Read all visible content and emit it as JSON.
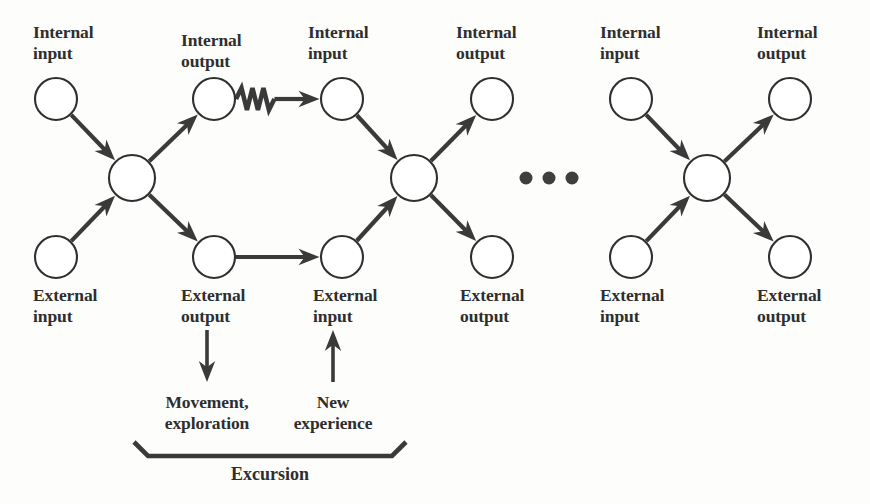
{
  "diagram": {
    "colors": {
      "stroke": "#3a3a3a",
      "node_stroke": "#2f2f2f",
      "node_fill": "#ffffff",
      "text": "#2e2e2e",
      "background": "#fdfdfc"
    },
    "labels": {
      "internal_input": "Internal\ninput",
      "internal_output": "Internal\noutput",
      "external_input": "External\ninput",
      "external_output": "External\noutput",
      "movement_exploration": "Movement,\nexploration",
      "new_experience": "New\nexperience",
      "excursion": "Excursion"
    },
    "nodes": [
      {
        "id": "n1-int-in",
        "name": "internal-input-node-1",
        "cx": 56,
        "cy": 99,
        "r": 21
      },
      {
        "id": "n1-ext-in",
        "name": "external-input-node-1",
        "cx": 56,
        "cy": 257,
        "r": 21
      },
      {
        "id": "n1-hub",
        "name": "hub-node-1",
        "cx": 132,
        "cy": 178,
        "r": 23
      },
      {
        "id": "n1-int-out",
        "name": "internal-output-node-1",
        "cx": 214,
        "cy": 99,
        "r": 21
      },
      {
        "id": "n1-ext-out",
        "name": "external-output-node-1",
        "cx": 214,
        "cy": 257,
        "r": 21
      },
      {
        "id": "n2-int-in",
        "name": "internal-input-node-2",
        "cx": 342,
        "cy": 99,
        "r": 21
      },
      {
        "id": "n2-ext-in",
        "name": "external-input-node-2",
        "cx": 342,
        "cy": 257,
        "r": 21
      },
      {
        "id": "n2-hub",
        "name": "hub-node-2",
        "cx": 414,
        "cy": 178,
        "r": 23
      },
      {
        "id": "n2-int-out",
        "name": "internal-output-node-2",
        "cx": 492,
        "cy": 99,
        "r": 21
      },
      {
        "id": "n2-ext-out",
        "name": "external-output-node-2",
        "cx": 492,
        "cy": 257,
        "r": 21
      },
      {
        "id": "n3-int-in",
        "name": "internal-input-node-3",
        "cx": 631,
        "cy": 99,
        "r": 21
      },
      {
        "id": "n3-ext-in",
        "name": "external-input-node-3",
        "cx": 631,
        "cy": 257,
        "r": 21
      },
      {
        "id": "n3-hub",
        "name": "hub-node-3",
        "cx": 707,
        "cy": 178,
        "r": 23
      },
      {
        "id": "n3-int-out",
        "name": "internal-output-node-3",
        "cx": 790,
        "cy": 99,
        "r": 21
      },
      {
        "id": "n3-ext-out",
        "name": "external-output-node-3",
        "cx": 790,
        "cy": 257,
        "r": 21
      }
    ],
    "edges": [
      {
        "name": "edge-internal-input-1-to-hub-1",
        "from": "n1-int-in",
        "to": "n1-hub",
        "style": "straight"
      },
      {
        "name": "edge-external-input-1-to-hub-1",
        "from": "n1-ext-in",
        "to": "n1-hub",
        "style": "straight"
      },
      {
        "name": "edge-hub-1-to-internal-output-1",
        "from": "n1-hub",
        "to": "n1-int-out",
        "style": "straight"
      },
      {
        "name": "edge-hub-1-to-external-output-1",
        "from": "n1-hub",
        "to": "n1-ext-out",
        "style": "straight"
      },
      {
        "name": "edge-internal-output-1-to-internal-input-2",
        "from": "n1-int-out",
        "to": "n2-int-in",
        "style": "zigzag"
      },
      {
        "name": "edge-external-output-1-to-external-input-2",
        "from": "n1-ext-out",
        "to": "n2-ext-in",
        "style": "straight"
      },
      {
        "name": "edge-internal-input-2-to-hub-2",
        "from": "n2-int-in",
        "to": "n2-hub",
        "style": "straight"
      },
      {
        "name": "edge-external-input-2-to-hub-2",
        "from": "n2-ext-in",
        "to": "n2-hub",
        "style": "straight"
      },
      {
        "name": "edge-hub-2-to-internal-output-2",
        "from": "n2-hub",
        "to": "n2-int-out",
        "style": "straight"
      },
      {
        "name": "edge-hub-2-to-external-output-2",
        "from": "n2-hub",
        "to": "n2-ext-out",
        "style": "straight"
      },
      {
        "name": "edge-internal-input-3-to-hub-3",
        "from": "n3-int-in",
        "to": "n3-hub",
        "style": "straight"
      },
      {
        "name": "edge-external-input-3-to-hub-3",
        "from": "n3-ext-in",
        "to": "n3-hub",
        "style": "straight"
      },
      {
        "name": "edge-hub-3-to-internal-output-3",
        "from": "n3-hub",
        "to": "n3-int-out",
        "style": "straight"
      },
      {
        "name": "edge-hub-3-to-external-output-3",
        "from": "n3-hub",
        "to": "n3-ext-out",
        "style": "straight"
      }
    ],
    "vertical_arrows": [
      {
        "name": "arrow-external-output-to-movement",
        "x": 207,
        "y1": 330,
        "y2": 382,
        "direction": "down"
      },
      {
        "name": "arrow-new-experience-to-external-input",
        "x": 333,
        "y1": 382,
        "y2": 330,
        "direction": "up"
      }
    ],
    "ellipsis": {
      "name": "continuation-ellipsis",
      "cy": 178,
      "r": 6.5,
      "cx": [
        526,
        549,
        572
      ]
    },
    "bracket": {
      "name": "excursion-bracket",
      "x1": 134,
      "x2": 406,
      "y_top": 442,
      "y_bar": 456,
      "inset": 14
    },
    "text_labels": [
      {
        "name": "label-internal-input-1",
        "text_key": "internal_input",
        "x": 33,
        "y": 22,
        "align": "left"
      },
      {
        "name": "label-internal-output-1",
        "text_key": "internal_output",
        "x": 181,
        "y": 30,
        "align": "left"
      },
      {
        "name": "label-internal-input-2",
        "text_key": "internal_input",
        "x": 308,
        "y": 22,
        "align": "left"
      },
      {
        "name": "label-internal-output-2",
        "text_key": "internal_output",
        "x": 456,
        "y": 22,
        "align": "left"
      },
      {
        "name": "label-internal-input-3",
        "text_key": "internal_input",
        "x": 600,
        "y": 22,
        "align": "left"
      },
      {
        "name": "label-internal-output-3",
        "text_key": "internal_output",
        "x": 757,
        "y": 22,
        "align": "left"
      },
      {
        "name": "label-external-input-1",
        "text_key": "external_input",
        "x": 33,
        "y": 285,
        "align": "left"
      },
      {
        "name": "label-external-output-1",
        "text_key": "external_output",
        "x": 181,
        "y": 285,
        "align": "left"
      },
      {
        "name": "label-external-input-2",
        "text_key": "external_input",
        "x": 313,
        "y": 285,
        "align": "left"
      },
      {
        "name": "label-external-output-2",
        "text_key": "external_output",
        "x": 460,
        "y": 285,
        "align": "left"
      },
      {
        "name": "label-external-input-3",
        "text_key": "external_input",
        "x": 600,
        "y": 285,
        "align": "left"
      },
      {
        "name": "label-external-output-3",
        "text_key": "external_output",
        "x": 757,
        "y": 285,
        "align": "left"
      },
      {
        "name": "label-movement-exploration",
        "text_key": "movement_exploration",
        "x": 207,
        "y": 392,
        "align": "center"
      },
      {
        "name": "label-new-experience",
        "text_key": "new_experience",
        "x": 333,
        "y": 392,
        "align": "center"
      }
    ],
    "excursion_label": {
      "name": "label-excursion",
      "x": 270,
      "y": 464
    }
  }
}
